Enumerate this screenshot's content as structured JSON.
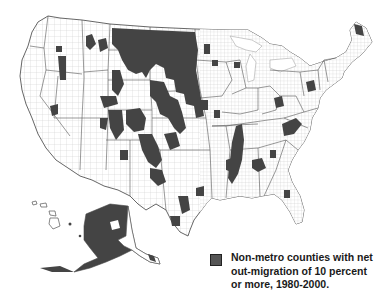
{
  "map": {
    "subject": "United States counties",
    "regions_shown": [
      "Contiguous United States",
      "Alaska",
      "Hawaii"
    ],
    "highlight_color": "#444444",
    "base_color": "#ffffff",
    "border_color": "#888888"
  },
  "legend": {
    "swatch_color": "#555555",
    "lines": [
      "Non-metro counties with net",
      "out-migration of 10 percent",
      "or more, 1980-2000."
    ]
  }
}
